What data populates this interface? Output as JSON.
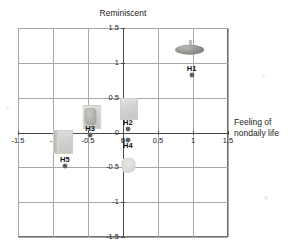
{
  "chart_data": {
    "type": "scatter",
    "title": "",
    "xlabel": "Feeling of nondaily life",
    "ylabel": "Reminiscent",
    "xlim": [
      -1.5,
      1.5
    ],
    "ylim": [
      -1.5,
      1.5
    ],
    "grid": true,
    "legend_position": "none",
    "axis_style": "centered-crosshair-with-outer-frame",
    "xticks": [
      "-1.5",
      "-1",
      "-0.5",
      "0",
      "0.5",
      "1",
      "1.5"
    ],
    "xtick_values": [
      -1.5,
      -1,
      -0.5,
      0,
      0.5,
      1,
      1.5
    ],
    "yticks": [
      "1.5",
      "1",
      "0.5",
      "0",
      "-0.5",
      "-1",
      "-1.5"
    ],
    "ytick_values": [
      1.5,
      1,
      0.5,
      0,
      -0.5,
      -1,
      -1.5
    ],
    "points": [
      {
        "label": "H1",
        "x": 0.98,
        "y": 0.82,
        "label_pos": "above",
        "thumb": {
          "kind": "dome",
          "x": 0.95,
          "y": 1.2,
          "w": 34,
          "h": 20
        }
      },
      {
        "label": "H2",
        "x": 0.07,
        "y": 0.05,
        "label_pos": "above",
        "thumb": {
          "kind": "square",
          "x": 0.08,
          "y": 0.34,
          "w": 18,
          "h": 22
        }
      },
      {
        "label": "H3",
        "x": -0.47,
        "y": -0.04,
        "label_pos": "above",
        "thumb": {
          "kind": "blob-dark",
          "x": -0.45,
          "y": 0.23,
          "w": 19,
          "h": 24
        }
      },
      {
        "label": "H4",
        "x": 0.07,
        "y": -0.11,
        "label_pos": "below",
        "thumb": {
          "kind": "blob-soft",
          "x": 0.08,
          "y": -0.46,
          "w": 19,
          "h": 20
        }
      },
      {
        "label": "H5",
        "x": -0.83,
        "y": -0.48,
        "label_pos": "above",
        "thumb": {
          "kind": "strip",
          "x": -0.86,
          "y": -0.13,
          "w": 20,
          "h": 24
        }
      }
    ]
  },
  "labels": {
    "top_axis_title": "Reminiscent",
    "right_axis_title_line1": "Feeling of",
    "right_axis_title_line2": "nondaily life"
  },
  "colors": {
    "frame": "#6f6f6f",
    "grid": "#a8a8a8",
    "axis": "#4a4a4a",
    "marker": "#5c5c5c",
    "text": "#1b1b1b",
    "background": "#ffffff"
  }
}
